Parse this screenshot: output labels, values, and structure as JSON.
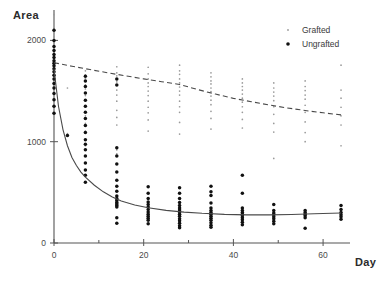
{
  "chart_data": {
    "type": "scatter",
    "title": "",
    "xlabel": "Day",
    "ylabel": "Area",
    "xlim": [
      0,
      66
    ],
    "ylim": [
      0,
      2300
    ],
    "grid": false,
    "xticks": [
      0,
      20,
      40,
      60
    ],
    "xtick_labels": [
      "0",
      "20",
      "40",
      "60"
    ],
    "yticks": [
      0,
      1000,
      2000
    ],
    "ytick_labels": [
      "0",
      "1000",
      "2000"
    ],
    "legend_position": "top-right",
    "series": [
      {
        "name": "Grafted",
        "marker": "small-dot",
        "color": "#9a9a9a",
        "fit_curve": {
          "style": "dashed",
          "description": "slow exponential decay from 1780 to 1265",
          "points": [
            [
              0,
              1780
            ],
            [
              4,
              1745
            ],
            [
              8,
              1712
            ],
            [
              12,
              1680
            ],
            [
              16,
              1650
            ],
            [
              20,
              1620
            ],
            [
              24,
              1592
            ],
            [
              28,
              1565
            ],
            [
              32,
              1515
            ],
            [
              36,
              1470
            ],
            [
              40,
              1428
            ],
            [
              44,
              1395
            ],
            [
              48,
              1362
            ],
            [
              52,
              1333
            ],
            [
              56,
              1308
            ],
            [
              60,
              1285
            ],
            [
              64,
              1265
            ]
          ]
        },
        "points": [
          [
            0,
            2255
          ],
          [
            0,
            2120
          ],
          [
            0,
            2035
          ],
          [
            0,
            1985
          ],
          [
            0,
            1930
          ],
          [
            0,
            1880
          ],
          [
            0,
            1840
          ],
          [
            0,
            1805
          ],
          [
            0,
            1770
          ],
          [
            0,
            1735
          ],
          [
            0,
            1700
          ],
          [
            0,
            1665
          ],
          [
            0,
            1610
          ],
          [
            0,
            1545
          ],
          [
            0,
            1480
          ],
          [
            0,
            1420
          ],
          [
            0,
            1355
          ],
          [
            0,
            1290
          ],
          [
            3,
            1530
          ],
          [
            3,
            1080
          ],
          [
            7,
            1700
          ],
          [
            7,
            1660
          ],
          [
            7,
            1625
          ],
          [
            7,
            1595
          ],
          [
            7,
            1560
          ],
          [
            7,
            1520
          ],
          [
            7,
            1455
          ],
          [
            7,
            1400
          ],
          [
            7,
            1340
          ],
          [
            7,
            1255
          ],
          [
            7,
            1180
          ],
          [
            7,
            1105
          ],
          [
            7,
            1015
          ],
          [
            7,
            960
          ],
          [
            14,
            1740
          ],
          [
            14,
            1680
          ],
          [
            14,
            1650
          ],
          [
            14,
            1615
          ],
          [
            14,
            1590
          ],
          [
            14,
            1560
          ],
          [
            14,
            1510
          ],
          [
            14,
            1460
          ],
          [
            14,
            1400
          ],
          [
            14,
            1310
          ],
          [
            14,
            1240
          ],
          [
            14,
            1165
          ],
          [
            14,
            920
          ],
          [
            14,
            880
          ],
          [
            21,
            1735
          ],
          [
            21,
            1670
          ],
          [
            21,
            1620
          ],
          [
            21,
            1580
          ],
          [
            21,
            1545
          ],
          [
            21,
            1500
          ],
          [
            21,
            1455
          ],
          [
            21,
            1400
          ],
          [
            21,
            1340
          ],
          [
            21,
            1285
          ],
          [
            21,
            1215
          ],
          [
            21,
            1105
          ],
          [
            28,
            1755
          ],
          [
            28,
            1700
          ],
          [
            28,
            1665
          ],
          [
            28,
            1620
          ],
          [
            28,
            1580
          ],
          [
            28,
            1540
          ],
          [
            28,
            1500
          ],
          [
            28,
            1460
          ],
          [
            28,
            1400
          ],
          [
            28,
            1345
          ],
          [
            28,
            1290
          ],
          [
            28,
            1190
          ],
          [
            28,
            1075
          ],
          [
            35,
            1680
          ],
          [
            35,
            1640
          ],
          [
            35,
            1600
          ],
          [
            35,
            1570
          ],
          [
            35,
            1530
          ],
          [
            35,
            1495
          ],
          [
            35,
            1450
          ],
          [
            35,
            1410
          ],
          [
            35,
            1365
          ],
          [
            35,
            1300
          ],
          [
            35,
            1230
          ],
          [
            35,
            1125
          ],
          [
            42,
            1620
          ],
          [
            42,
            1580
          ],
          [
            42,
            1545
          ],
          [
            42,
            1510
          ],
          [
            42,
            1470
          ],
          [
            42,
            1430
          ],
          [
            42,
            1390
          ],
          [
            42,
            1345
          ],
          [
            42,
            1290
          ],
          [
            42,
            1220
          ],
          [
            42,
            1135
          ],
          [
            49,
            1580
          ],
          [
            49,
            1530
          ],
          [
            49,
            1490
          ],
          [
            49,
            1450
          ],
          [
            49,
            1405
          ],
          [
            49,
            1345
          ],
          [
            49,
            1270
          ],
          [
            49,
            1180
          ],
          [
            49,
            1095
          ],
          [
            49,
            835
          ],
          [
            56,
            1600
          ],
          [
            56,
            1545
          ],
          [
            56,
            1505
          ],
          [
            56,
            1460
          ],
          [
            56,
            1420
          ],
          [
            56,
            1360
          ],
          [
            56,
            1290
          ],
          [
            56,
            1195
          ],
          [
            56,
            1090
          ],
          [
            56,
            1000
          ],
          [
            64,
            1755
          ],
          [
            64,
            1510
          ],
          [
            64,
            1430
          ],
          [
            64,
            1340
          ],
          [
            64,
            1255
          ],
          [
            64,
            1165
          ],
          [
            64,
            960
          ]
        ]
      },
      {
        "name": "Ungrafted",
        "marker": "dot",
        "color": "#111111",
        "fit_curve": {
          "style": "solid",
          "description": "rapid exponential decay from 1720 to plateau near 290",
          "points": [
            [
              0,
              1720
            ],
            [
              1,
              1350
            ],
            [
              2,
              1120
            ],
            [
              3,
              960
            ],
            [
              4,
              845
            ],
            [
              5,
              765
            ],
            [
              6,
              700
            ],
            [
              7,
              650
            ],
            [
              9,
              570
            ],
            [
              11,
              505
            ],
            [
              13,
              455
            ],
            [
              15,
              415
            ],
            [
              18,
              375
            ],
            [
              21,
              348
            ],
            [
              25,
              322
            ],
            [
              29,
              305
            ],
            [
              33,
              293
            ],
            [
              38,
              283
            ],
            [
              43,
              278
            ],
            [
              48,
              278
            ],
            [
              53,
              282
            ],
            [
              58,
              288
            ],
            [
              64,
              296
            ]
          ]
        },
        "points": [
          [
            0,
            2100
          ],
          [
            0,
            2000
          ],
          [
            0,
            1940
          ],
          [
            0,
            1900
          ],
          [
            0,
            1860
          ],
          [
            0,
            1830
          ],
          [
            0,
            1800
          ],
          [
            0,
            1775
          ],
          [
            0,
            1750
          ],
          [
            0,
            1720
          ],
          [
            0,
            1690
          ],
          [
            0,
            1655
          ],
          [
            0,
            1620
          ],
          [
            0,
            1575
          ],
          [
            0,
            1530
          ],
          [
            0,
            1475
          ],
          [
            0,
            1415
          ],
          [
            0,
            1350
          ],
          [
            0,
            1280
          ],
          [
            3,
            1060
          ],
          [
            7,
            1645
          ],
          [
            7,
            1600
          ],
          [
            7,
            1545
          ],
          [
            7,
            1480
          ],
          [
            7,
            1410
          ],
          [
            7,
            1350
          ],
          [
            7,
            1290
          ],
          [
            7,
            1230
          ],
          [
            7,
            1160
          ],
          [
            7,
            1090
          ],
          [
            7,
            1020
          ],
          [
            7,
            975
          ],
          [
            7,
            920
          ],
          [
            7,
            860
          ],
          [
            7,
            790
          ],
          [
            7,
            720
          ],
          [
            7,
            670
          ],
          [
            7,
            600
          ],
          [
            14,
            1620
          ],
          [
            14,
            1560
          ],
          [
            14,
            940
          ],
          [
            14,
            860
          ],
          [
            14,
            780
          ],
          [
            14,
            700
          ],
          [
            14,
            620
          ],
          [
            14,
            560
          ],
          [
            14,
            510
          ],
          [
            14,
            465
          ],
          [
            14,
            440
          ],
          [
            14,
            420
          ],
          [
            14,
            400
          ],
          [
            14,
            385
          ],
          [
            14,
            370
          ],
          [
            14,
            355
          ],
          [
            14,
            250
          ],
          [
            14,
            195
          ],
          [
            21,
            555
          ],
          [
            21,
            490
          ],
          [
            21,
            440
          ],
          [
            21,
            405
          ],
          [
            21,
            380
          ],
          [
            21,
            355
          ],
          [
            21,
            330
          ],
          [
            21,
            305
          ],
          [
            21,
            285
          ],
          [
            21,
            265
          ],
          [
            21,
            245
          ],
          [
            21,
            225
          ],
          [
            21,
            190
          ],
          [
            28,
            545
          ],
          [
            28,
            490
          ],
          [
            28,
            440
          ],
          [
            28,
            400
          ],
          [
            28,
            370
          ],
          [
            28,
            345
          ],
          [
            28,
            325
          ],
          [
            28,
            305
          ],
          [
            28,
            285
          ],
          [
            28,
            265
          ],
          [
            28,
            240
          ],
          [
            28,
            220
          ],
          [
            28,
            195
          ],
          [
            28,
            170
          ],
          [
            28,
            150
          ],
          [
            35,
            560
          ],
          [
            35,
            505
          ],
          [
            35,
            470
          ],
          [
            35,
            395
          ],
          [
            35,
            345
          ],
          [
            35,
            320
          ],
          [
            35,
            300
          ],
          [
            35,
            285
          ],
          [
            35,
            265
          ],
          [
            35,
            245
          ],
          [
            35,
            225
          ],
          [
            35,
            200
          ],
          [
            35,
            175
          ],
          [
            35,
            155
          ],
          [
            42,
            670
          ],
          [
            42,
            490
          ],
          [
            42,
            345
          ],
          [
            42,
            320
          ],
          [
            42,
            300
          ],
          [
            42,
            285
          ],
          [
            42,
            270
          ],
          [
            42,
            250
          ],
          [
            42,
            230
          ],
          [
            42,
            205
          ],
          [
            42,
            180
          ],
          [
            49,
            380
          ],
          [
            49,
            320
          ],
          [
            49,
            295
          ],
          [
            49,
            280
          ],
          [
            49,
            260
          ],
          [
            49,
            240
          ],
          [
            49,
            215
          ],
          [
            49,
            190
          ],
          [
            56,
            320
          ],
          [
            56,
            300
          ],
          [
            56,
            285
          ],
          [
            56,
            270
          ],
          [
            56,
            250
          ],
          [
            56,
            145
          ],
          [
            64,
            370
          ],
          [
            64,
            330
          ],
          [
            64,
            300
          ],
          [
            64,
            280
          ],
          [
            64,
            260
          ],
          [
            64,
            235
          ]
        ]
      }
    ]
  },
  "axes": {
    "y_title": "Area",
    "x_title": "Day"
  },
  "legend": {
    "items": [
      {
        "label": "Grafted",
        "marker": "small-dot-marker",
        "color": "#9a9a9a"
      },
      {
        "label": "Ungrafted",
        "marker": "dot-marker",
        "color": "#111111"
      }
    ]
  }
}
